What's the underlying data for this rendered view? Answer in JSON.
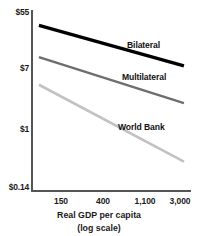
{
  "chart_data": {
    "type": "line",
    "title": "",
    "subtitle": "",
    "xlabel": "Real GDP per capita",
    "xlabel_sub": "(log scale)",
    "ylabel": "",
    "xscale": "log",
    "yscale": "log",
    "grid": false,
    "legend_position": "inline-right",
    "xlim": [
      130,
      3400
    ],
    "ylim": [
      0.14,
      55
    ],
    "x_tick_labels": [
      "150",
      "400",
      "1,100",
      "3,000"
    ],
    "x_tick_values": [
      150,
      400,
      1100,
      3000
    ],
    "y_tick_labels": [
      "$55",
      "$7",
      "$1",
      "$0.14"
    ],
    "y_tick_values": [
      55,
      7,
      1,
      0.14
    ],
    "series": [
      {
        "name": "Bilateral",
        "color": "#000000",
        "width": 3.2,
        "x": [
          150,
          3000
        ],
        "values": [
          33.0,
          8.6
        ]
      },
      {
        "name": "Multilateral",
        "color": "#6e6e6e",
        "width": 2.4,
        "x": [
          150,
          3000
        ],
        "values": [
          11.5,
          2.5
        ]
      },
      {
        "name": "World Bank",
        "color": "#c2c2c2",
        "width": 2.6,
        "x": [
          150,
          3000
        ],
        "values": [
          4.6,
          0.36
        ]
      }
    ]
  },
  "axis": {
    "y_ticks": [
      {
        "label": "$55",
        "top": 8
      },
      {
        "label": "$7",
        "top": 64
      },
      {
        "label": "$1",
        "top": 125
      },
      {
        "label": "$0.14",
        "top": 183
      }
    ],
    "x_ticks": [
      {
        "label": "150",
        "left": 61
      },
      {
        "label": "400",
        "left": 103
      },
      {
        "label": "1,100",
        "left": 145
      },
      {
        "label": "3,000",
        "left": 180
      }
    ]
  },
  "series_labels": {
    "bilateral": "Bilateral",
    "multilateral": "Multilateral",
    "world_bank": "World Bank"
  },
  "axis_title": {
    "main": "Real GDP per capita",
    "sub": "(log scale)"
  }
}
